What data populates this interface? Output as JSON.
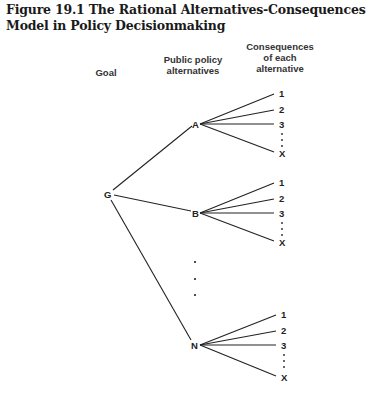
{
  "figure": {
    "title": "Figure 19.1 The Rational Alternatives-Consequences Model in Policy Decisionmaking"
  },
  "headers": {
    "goal": "Goal",
    "alternatives_line1": "Public policy",
    "alternatives_line2": "alternatives",
    "consequences_line1": "Consequences",
    "consequences_line2": "of each",
    "consequences_line3": "alternative"
  },
  "tree": {
    "root": "G",
    "alternatives": [
      {
        "label": "A",
        "consequences": [
          "1",
          "2",
          "3",
          "X"
        ]
      },
      {
        "label": "B",
        "consequences": [
          "1",
          "2",
          "3",
          "X"
        ]
      },
      {
        "label": "N",
        "consequences": [
          "1",
          "2",
          "3",
          "X"
        ]
      }
    ],
    "ellipsis": "⋮"
  },
  "colors": {
    "ink": "#222222",
    "background": "#ffffff"
  }
}
